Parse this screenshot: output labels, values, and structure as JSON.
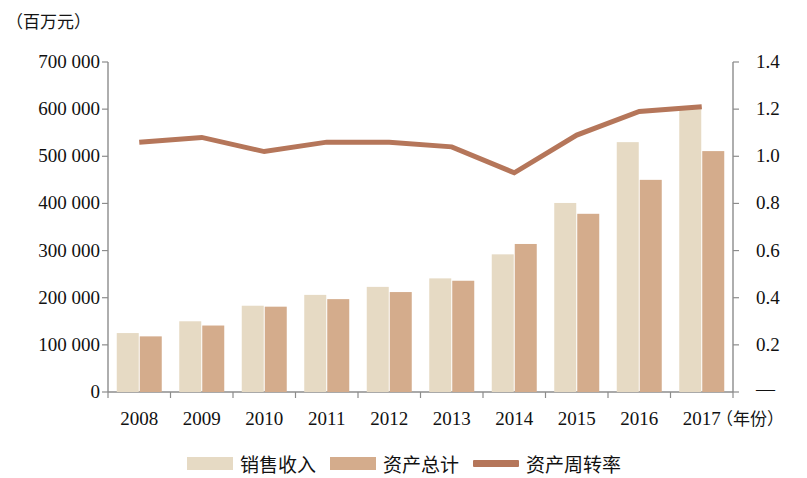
{
  "chart_data": {
    "type": "bar",
    "title": "",
    "subtitle": "",
    "xlabel": "（年份）",
    "ylabel": "（百万元）",
    "y_unit_caption": "（百万元）",
    "x_unit_caption": "（年份）",
    "categories": [
      "2008",
      "2009",
      "2010",
      "2011",
      "2012",
      "2013",
      "2014",
      "2015",
      "2016",
      "2017"
    ],
    "ylim": [
      0,
      700000
    ],
    "yticks": [
      0,
      100000,
      200000,
      300000,
      400000,
      500000,
      600000,
      700000
    ],
    "ytick_labels": [
      "0",
      "100 000",
      "200 000",
      "300 000",
      "400 000",
      "500 000",
      "600 000",
      "700 000"
    ],
    "y2lim": [
      0,
      1.4
    ],
    "y2ticks": [
      0,
      0.2,
      0.4,
      0.6,
      0.8,
      1.0,
      1.2,
      1.4
    ],
    "y2tick_labels": [
      "—",
      "0.2",
      "0.4",
      "0.6",
      "0.8",
      "1.0",
      "1.2",
      "1.4"
    ],
    "grid": false,
    "legend_position": "bottom-center",
    "series": [
      {
        "name": "销售收入",
        "type": "bar",
        "axis": "left",
        "color": "#e6dac4",
        "values": [
          125000,
          150000,
          183000,
          206000,
          223000,
          241000,
          292000,
          401000,
          530000,
          605000
        ]
      },
      {
        "name": "资产总计",
        "type": "bar",
        "axis": "left",
        "color": "#d4ac8c",
        "values": [
          118000,
          141000,
          181000,
          197000,
          212000,
          236000,
          314000,
          378000,
          450000,
          511000
        ]
      },
      {
        "name": "资产周转率",
        "type": "line",
        "axis": "right",
        "color": "#b5765a",
        "values": [
          1.06,
          1.08,
          1.02,
          1.06,
          1.06,
          1.04,
          0.93,
          1.09,
          1.19,
          1.21
        ]
      }
    ]
  },
  "legend": {
    "items": [
      {
        "label": "销售收入",
        "marker": "bar-swatch",
        "color": "#e6dac4"
      },
      {
        "label": "资产总计",
        "marker": "bar-swatch",
        "color": "#d4ac8c"
      },
      {
        "label": "资产周转率",
        "marker": "line-swatch",
        "color": "#b5765a"
      }
    ]
  },
  "colors": {
    "sales_revenue": "#e6dac4",
    "total_assets": "#d4ac8c",
    "asset_turnover_line": "#b5765a",
    "axis": "#8c8c8c",
    "text": "#111111",
    "background": "#ffffff"
  }
}
